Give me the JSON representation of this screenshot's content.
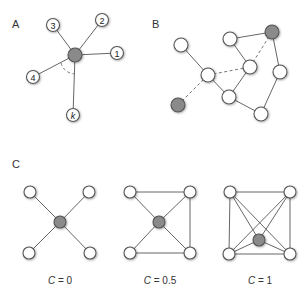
{
  "panels": {
    "A": {
      "label": "A",
      "center_node": {
        "x": 75,
        "y": 55,
        "fill": "#8a8a8a"
      },
      "neighbors": [
        {
          "label": "1",
          "x": 117,
          "y": 53
        },
        {
          "label": "2",
          "x": 102,
          "y": 20
        },
        {
          "label": "3",
          "x": 53,
          "y": 25
        },
        {
          "label": "4",
          "x": 33,
          "y": 77
        },
        {
          "label": "k",
          "x": 73,
          "y": 115
        }
      ],
      "ellipsis_arc": "dashed arc between node 4 and node k"
    },
    "B": {
      "label": "B",
      "nodes": [
        {
          "id": "n1",
          "x": 181,
          "y": 45,
          "fill": "white"
        },
        {
          "id": "n2",
          "x": 230,
          "y": 39,
          "fill": "white"
        },
        {
          "id": "n3",
          "x": 272,
          "y": 32,
          "fill": "gray"
        },
        {
          "id": "n4",
          "x": 208,
          "y": 75,
          "fill": "white"
        },
        {
          "id": "n5",
          "x": 250,
          "y": 67,
          "fill": "white"
        },
        {
          "id": "n6",
          "x": 280,
          "y": 72,
          "fill": "white"
        },
        {
          "id": "n7",
          "x": 229,
          "y": 97,
          "fill": "white"
        },
        {
          "id": "n8",
          "x": 261,
          "y": 114,
          "fill": "white"
        },
        {
          "id": "n9",
          "x": 178,
          "y": 105,
          "fill": "gray"
        }
      ],
      "edges": [
        {
          "from": "n1",
          "to": "n4",
          "style": "solid"
        },
        {
          "from": "n2",
          "to": "n3",
          "style": "solid"
        },
        {
          "from": "n2",
          "to": "n5",
          "style": "solid"
        },
        {
          "from": "n4",
          "to": "n7",
          "style": "solid"
        },
        {
          "from": "n5",
          "to": "n7",
          "style": "solid"
        },
        {
          "from": "n3",
          "to": "n6",
          "style": "solid"
        },
        {
          "from": "n6",
          "to": "n8",
          "style": "solid"
        },
        {
          "from": "n7",
          "to": "n8",
          "style": "solid"
        },
        {
          "from": "n4",
          "to": "n5",
          "style": "dashed"
        },
        {
          "from": "n5",
          "to": "n3",
          "style": "dashed"
        },
        {
          "from": "n9",
          "to": "n4",
          "style": "dashed"
        }
      ]
    },
    "C": {
      "label": "C",
      "graphs": [
        {
          "caption_var": "C",
          "caption_eq": " = ",
          "caption_val": "0",
          "caption": "C = 0"
        },
        {
          "caption_var": "C",
          "caption_eq": " = ",
          "caption_val": "0.5",
          "caption": "C = 0.5"
        },
        {
          "caption_var": "C",
          "caption_eq": " = ",
          "caption_val": "1",
          "caption": "C = 1"
        }
      ]
    }
  },
  "colors": {
    "node_gray": "#8a8a8a",
    "node_white": "#ffffff",
    "edge": "#555555"
  }
}
